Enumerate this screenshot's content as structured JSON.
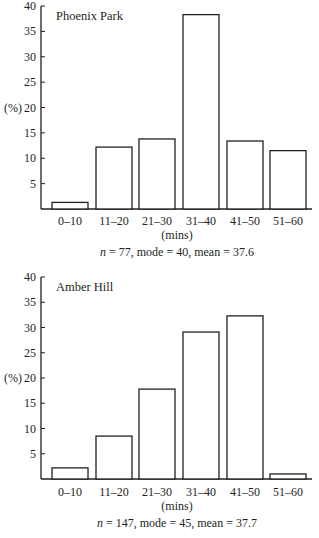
{
  "chart_data": [
    {
      "type": "bar",
      "title": "Phoenix Park",
      "categories": [
        "0–10",
        "11–20",
        "21–30",
        "31–40",
        "41–50",
        "51–60"
      ],
      "values": [
        1.3,
        12.2,
        13.8,
        38.3,
        13.4,
        11.5
      ],
      "xlabel": "(mins)",
      "ylabel": "(%)",
      "yticks": [
        5,
        10,
        15,
        20,
        25,
        30,
        35,
        40
      ],
      "ylim": [
        0,
        40
      ],
      "caption": {
        "n_label": "n",
        "rest": " = 77, mode = 40, mean = 37.6"
      },
      "grid": false,
      "legend": null
    },
    {
      "type": "bar",
      "title": "Amber Hill",
      "categories": [
        "0–10",
        "11–20",
        "21–30",
        "31–40",
        "41–50",
        "51–60"
      ],
      "values": [
        2.2,
        8.5,
        17.8,
        29.1,
        32.3,
        1.0
      ],
      "xlabel": "(mins)",
      "ylabel": "(%)",
      "yticks": [
        5,
        10,
        15,
        20,
        25,
        30,
        35,
        40
      ],
      "ylim": [
        0,
        40
      ],
      "caption": {
        "n_label": "n",
        "rest": " = 147, mode = 45, mean = 37.7"
      },
      "grid": false,
      "legend": null
    }
  ],
  "style": {
    "stroke": "#231f20",
    "bar_fill": "#ffffff"
  }
}
